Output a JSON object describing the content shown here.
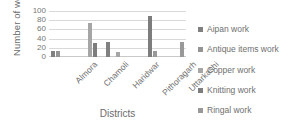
{
  "chart_data": {
    "type": "bar",
    "title": "",
    "xlabel": "Districts",
    "ylabel": "Number of workers",
    "categories": [
      "Almora",
      "Chamoli",
      "Haridwar",
      "Pithoragarh",
      "Uttarkashi"
    ],
    "yticks": [
      0,
      20,
      40,
      60,
      80,
      100
    ],
    "ylim": [
      0,
      100
    ],
    "grid": true,
    "legend_position": "right",
    "series": [
      {
        "name": "Aipan work",
        "color": "#808080",
        "values": [
          12,
          0,
          32,
          0,
          0
        ]
      },
      {
        "name": "Antique items work",
        "color": "#949494",
        "values": [
          12,
          0,
          0,
          0,
          0
        ]
      },
      {
        "name": "Copper work",
        "color": "#a6a6a6",
        "values": [
          0,
          75,
          10,
          0,
          0
        ]
      },
      {
        "name": "Knitting work",
        "color": "#7d7d7d",
        "values": [
          0,
          30,
          0,
          90,
          0
        ]
      },
      {
        "name": "Ringal work",
        "color": "#999999",
        "values": [
          0,
          0,
          0,
          13,
          32
        ]
      }
    ]
  },
  "axes": {
    "y_title": "Number of workers",
    "x_title": "Districts"
  },
  "colors": {
    "gridline": "#d9d9d9",
    "axis": "#c9c9c9",
    "text": "#6f6f6f",
    "background": "#ffffff"
  }
}
